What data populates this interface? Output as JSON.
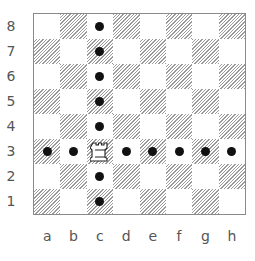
{
  "board": {
    "files": [
      "a",
      "b",
      "c",
      "d",
      "e",
      "f",
      "g",
      "h"
    ],
    "ranks": [
      "8",
      "7",
      "6",
      "5",
      "4",
      "3",
      "2",
      "1"
    ],
    "pieces": [
      {
        "square": "c3",
        "piece": "white-rook",
        "glyph": "♖"
      }
    ],
    "markers": [
      "c8",
      "c7",
      "c6",
      "c5",
      "c4",
      "a3",
      "b3",
      "d3",
      "e3",
      "f3",
      "g3",
      "h3",
      "c2",
      "c1"
    ],
    "colors": {
      "light": "#ffffff",
      "dark_hatch": "#9a9a9a",
      "border": "#8a8a8a",
      "marker": "#111111",
      "label": "#555555"
    }
  }
}
